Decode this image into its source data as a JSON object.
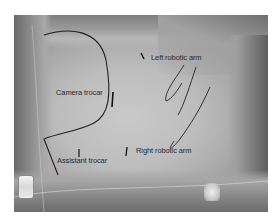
{
  "figure": {
    "labels": {
      "camera_trocar": "Camera trocar",
      "left_robotic_arm": "Left robotic arm",
      "right_robotic_arm": "Right robotic arm",
      "assistant_trocar": "Assistant trocar"
    }
  }
}
